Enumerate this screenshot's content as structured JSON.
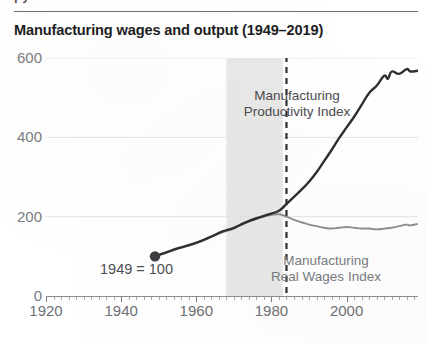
{
  "page": {
    "cut_off_text_above_rule": "py",
    "title": "Manufacturing wages and output (1949–2019)"
  },
  "chart_data": {
    "type": "line",
    "title": "Manufacturing wages and output (1949–2019)",
    "subtitle": "",
    "xlabel": "",
    "ylabel": "",
    "xlim": [
      1920,
      2019
    ],
    "ylim": [
      0,
      600
    ],
    "grid": false,
    "legend_position": "inline-annotations",
    "y_ticks": [
      0,
      200,
      400,
      600
    ],
    "y_tick_labels": [
      "0",
      "200",
      "400",
      "600"
    ],
    "x_ticks": [
      1920,
      1940,
      1960,
      1980,
      2000
    ],
    "x_tick_labels": [
      "1920",
      "1940",
      "1960",
      "1980",
      "2000"
    ],
    "x_minor_tick_interval": 2,
    "annotations": [
      {
        "name": "productivity-label",
        "text_line1": "Manufacturing",
        "text_line2": "Productivity Index",
        "x": 1972,
        "y": 470
      },
      {
        "name": "wages-label",
        "text_line1": "Manufacturing",
        "text_line2": "Real Wages Index",
        "x": 1998,
        "y": 70
      },
      {
        "name": "base-year-label",
        "text": "1949 = 100",
        "x": 1949,
        "y": 100
      }
    ],
    "marker_points": [
      {
        "name": "base-year-marker",
        "x": 1949,
        "y": 100,
        "color": "#3c3d41"
      }
    ],
    "vertical_rule": {
      "name": "divergence-line",
      "x": 1984,
      "style": "dashed",
      "color": "#2f3034"
    },
    "shaded_band": {
      "name": "shaded-period-band",
      "x_start": 1968,
      "x_end": 1983,
      "color": "#e8e8e6"
    },
    "series": [
      {
        "name": "Manufacturing Productivity Index",
        "color": "#2e2f33",
        "width": 2.4,
        "x": [
          1949,
          1952,
          1955,
          1958,
          1961,
          1964,
          1967,
          1970,
          1973,
          1976,
          1979,
          1982,
          1984,
          1986,
          1988,
          1990,
          1992,
          1994,
          1996,
          1998,
          2000,
          2002,
          2004,
          2006,
          2008,
          2010,
          2011,
          2012,
          2014,
          2016,
          2017,
          2019
        ],
        "values": [
          100,
          110,
          120,
          128,
          138,
          150,
          163,
          172,
          185,
          196,
          205,
          215,
          232,
          250,
          268,
          288,
          312,
          340,
          368,
          398,
          425,
          452,
          482,
          512,
          530,
          555,
          548,
          566,
          560,
          572,
          566,
          568
        ]
      },
      {
        "name": "Manufacturing Real Wages Index",
        "color": "#8d8e92",
        "width": 1.9,
        "x": [
          1949,
          1952,
          1955,
          1958,
          1961,
          1964,
          1967,
          1970,
          1973,
          1976,
          1979,
          1982,
          1984,
          1986,
          1988,
          1990,
          1992,
          1994,
          1996,
          1998,
          2000,
          2002,
          2004,
          2006,
          2008,
          2010,
          2012,
          2014,
          2016,
          2017,
          2019
        ],
        "values": [
          100,
          109,
          119,
          127,
          137,
          149,
          161,
          170,
          184,
          194,
          203,
          206,
          200,
          192,
          186,
          180,
          176,
          172,
          170,
          172,
          174,
          172,
          170,
          170,
          168,
          170,
          172,
          176,
          180,
          178,
          182
        ]
      }
    ]
  }
}
